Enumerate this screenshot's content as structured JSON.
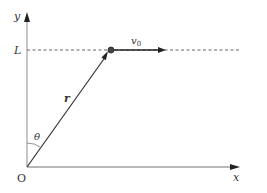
{
  "diagram": {
    "labels": {
      "y_axis": "y",
      "x_axis": "x",
      "height": "L",
      "velocity": "v",
      "velocity_sub": "0",
      "position_vector": "r",
      "angle": "θ",
      "origin": "O"
    },
    "colors": {
      "axis": "#9a9a9a",
      "line": "#333333",
      "dashed": "#555555",
      "point": "#444444"
    }
  }
}
